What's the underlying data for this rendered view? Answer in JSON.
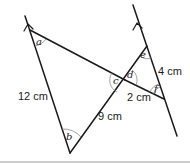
{
  "diagram": {
    "angle_labels": {
      "a": "a",
      "b": "b",
      "c": "c",
      "d": "d",
      "e": "e",
      "f": "f"
    },
    "length_labels": {
      "left_side": "12 cm",
      "middle_segment": "9 cm",
      "right_side": "4 cm",
      "short_segment": "2 cm"
    },
    "colors": {
      "line": "#1a1a1a",
      "arc": "#8a8a8a",
      "separator": "#bdbdbd"
    }
  }
}
